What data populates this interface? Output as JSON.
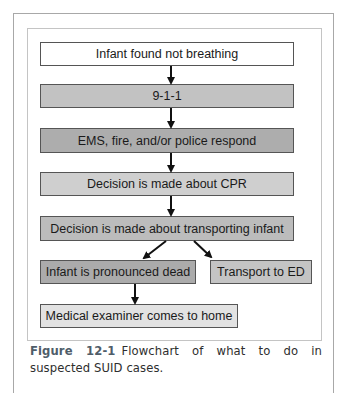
{
  "flowchart": {
    "nodes": [
      {
        "id": "n1",
        "label": "Infant found not breathing",
        "fill": "#ffffff",
        "x": 40,
        "y": 42,
        "w": 254,
        "h": 24
      },
      {
        "id": "n2",
        "label": "9-1-1",
        "fill": "#c2c2c2",
        "x": 40,
        "y": 84,
        "w": 254,
        "h": 24
      },
      {
        "id": "n3",
        "label": "EMS, fire, and/or police respond",
        "fill": "#adadad",
        "x": 40,
        "y": 128,
        "w": 254,
        "h": 25
      },
      {
        "id": "n4",
        "label": "Decision is made about CPR",
        "fill": "#cfcfcf",
        "x": 40,
        "y": 172,
        "w": 254,
        "h": 24
      },
      {
        "id": "n5",
        "label": "Decision is made about transporting infant",
        "fill": "#bcbcbc",
        "x": 40,
        "y": 216,
        "w": 254,
        "h": 25
      },
      {
        "id": "n6",
        "label": "Infant is pronounced dead",
        "fill": "#ababab",
        "x": 40,
        "y": 260,
        "w": 156,
        "h": 24
      },
      {
        "id": "n7",
        "label": "Transport to ED",
        "fill": "#c4c4c4",
        "x": 210,
        "y": 260,
        "w": 102,
        "h": 24
      },
      {
        "id": "n8",
        "label": "Medical examiner comes to home",
        "fill": "#e2e2e2",
        "x": 40,
        "y": 304,
        "w": 198,
        "h": 24
      }
    ],
    "edges": [
      {
        "from": "n1",
        "to": "n2"
      },
      {
        "from": "n2",
        "to": "n3"
      },
      {
        "from": "n3",
        "to": "n4"
      },
      {
        "from": "n4",
        "to": "n5"
      },
      {
        "from": "n5",
        "to": "n6"
      },
      {
        "from": "n5",
        "to": "n7"
      },
      {
        "from": "n6",
        "to": "n8"
      }
    ]
  },
  "caption": {
    "label": "Figure 12-1",
    "text": "Flowchart of what to do in suspected SUID cases."
  }
}
